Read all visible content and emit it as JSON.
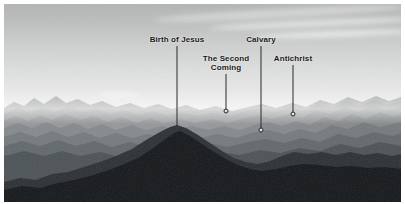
{
  "image": {
    "kind": "photograph",
    "subject": "mountain-range-silhouette-layers",
    "palette": "grayscale",
    "border_color": "#ffffff",
    "sky_top_color": "#b3b5b5",
    "sky_bottom_color": "#f3f4f3",
    "ridge_colors": [
      "#aeb0b0",
      "#9ea1a1",
      "#8d9191",
      "#7c8081",
      "#6b7071",
      "#565b5c",
      "#3d4243",
      "#24282a",
      "#121516"
    ],
    "annotation_line_color": "#2a2a2a",
    "annotation_text_color": "#141414"
  },
  "annotations": [
    {
      "id": "birth-of-jesus",
      "label": "Birth of Jesus",
      "label_lines": [
        "Birth of Jesus"
      ],
      "label_x": 173,
      "label_y": 31,
      "line_x": 173,
      "line_top": 42,
      "line_bottom": 122,
      "has_dot": false,
      "dot_x": 173,
      "dot_y": 122
    },
    {
      "id": "the-second-coming",
      "label": "The Second Coming",
      "label_lines": [
        "The Second",
        "Coming"
      ],
      "label_x": 222,
      "label_y": 50,
      "line_x": 222,
      "line_top": 70,
      "line_bottom": 107,
      "has_dot": true,
      "dot_x": 222,
      "dot_y": 107
    },
    {
      "id": "calvary",
      "label": "Calvary",
      "label_lines": [
        "Calvary"
      ],
      "label_x": 257,
      "label_y": 31,
      "line_x": 257,
      "line_top": 42,
      "line_bottom": 126,
      "has_dot": true,
      "dot_x": 257,
      "dot_y": 126
    },
    {
      "id": "antichrist",
      "label": "Antichrist",
      "label_lines": [
        "Antichrist"
      ],
      "label_x": 289,
      "label_y": 50,
      "line_x": 289,
      "line_top": 61,
      "line_bottom": 110,
      "has_dot": true,
      "dot_x": 289,
      "dot_y": 110
    }
  ]
}
